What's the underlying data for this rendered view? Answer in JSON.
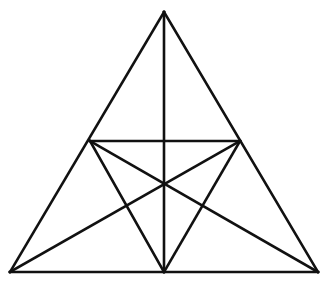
{
  "figure": {
    "type": "line-diagram",
    "background_color": "#ffffff",
    "stroke_color": "#111111",
    "stroke_width": 2.6,
    "canvas": {
      "width": 329,
      "height": 281
    },
    "points": {
      "apex": {
        "label": "A",
        "x": 164,
        "y": 12,
        "role": "top vertex of outer triangle"
      },
      "bottom_left": {
        "label": "B",
        "x": 10,
        "y": 272,
        "role": "bottom-left vertex of outer triangle"
      },
      "bottom_right": {
        "label": "C",
        "x": 318,
        "y": 272,
        "role": "bottom-right vertex of outer triangle"
      },
      "left_midpoint": {
        "label": "M",
        "x": 90,
        "y": 141,
        "role": "midpoint of left side AB"
      },
      "right_midpoint": {
        "label": "N",
        "x": 240,
        "y": 141,
        "role": "midpoint of right side AC"
      },
      "bottom_center": {
        "label": "P",
        "x": 164,
        "y": 272,
        "role": "midpoint of base BC"
      },
      "center": {
        "label": "O",
        "x": 164,
        "y": 183,
        "role": "central intersection of six lines"
      }
    },
    "segments": [
      {
        "name": "outer-left-side",
        "from": "apex",
        "to": "bottom_left",
        "x1": 164,
        "y1": 12,
        "x2": 10,
        "y2": 272
      },
      {
        "name": "outer-right-side",
        "from": "apex",
        "to": "bottom_right",
        "x1": 164,
        "y1": 12,
        "x2": 318,
        "y2": 272
      },
      {
        "name": "outer-base",
        "from": "bottom_left",
        "to": "bottom_right",
        "x1": 10,
        "y1": 272,
        "x2": 318,
        "y2": 272
      },
      {
        "name": "horizontal-midline",
        "from": "left_midpoint",
        "to": "right_midpoint",
        "x1": 90,
        "y1": 141,
        "x2": 240,
        "y2": 141
      },
      {
        "name": "vertical-altitude",
        "from": "apex",
        "to": "bottom_center",
        "x1": 164,
        "y1": 12,
        "x2": 164,
        "y2": 272
      },
      {
        "name": "cevian-left-mid-to-base-center",
        "from": "left_midpoint",
        "to": "bottom_center",
        "x1": 90,
        "y1": 141,
        "x2": 164,
        "y2": 272
      },
      {
        "name": "cevian-right-mid-to-base-center",
        "from": "right_midpoint",
        "to": "bottom_center",
        "x1": 240,
        "y1": 141,
        "x2": 164,
        "y2": 272
      },
      {
        "name": "cevian-bottom-left-to-right-mid",
        "from": "bottom_left",
        "to": "right_midpoint",
        "x1": 10,
        "y1": 272,
        "x2": 240,
        "y2": 141
      },
      {
        "name": "cevian-bottom-right-to-left-mid",
        "from": "bottom_right",
        "to": "left_midpoint",
        "x1": 318,
        "y1": 272,
        "x2": 90,
        "y2": 141
      }
    ]
  }
}
